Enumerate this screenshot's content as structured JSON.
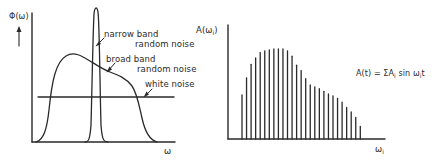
{
  "left_panel": {
    "y_axis_label": "Φ(ω)",
    "x_axis_label": "ω",
    "annotations": {
      "narrow_line1": "narrow band",
      "narrow_line2": "random noise",
      "broad_line1": "broad band",
      "broad_line2": "random noise",
      "white": "white noise"
    }
  },
  "right_panel": {
    "y_axis_label_main": "A(ω",
    "y_axis_label_sub": "i",
    "y_axis_label_end": ")",
    "x_axis_label_main": "ω",
    "x_axis_label_sub": "i",
    "formula": {
      "part1": "A(t) = ΣA",
      "sub1": "i",
      "part2": " sin ω",
      "sub2": "i",
      "part3": "t"
    }
  },
  "chart_data": [
    {
      "type": "line",
      "title": "Power spectral density of noise types",
      "xlabel": "ω",
      "ylabel": "Φ(ω)",
      "grid": false,
      "series": [
        {
          "name": "narrow band random noise",
          "shape": "sharp peak",
          "x": [
            0.3,
            0.34,
            0.36,
            0.38,
            0.42
          ],
          "y": [
            0.0,
            0.3,
            1.0,
            0.3,
            0.0
          ]
        },
        {
          "name": "broad band random noise",
          "shape": "broad hump",
          "x": [
            0.02,
            0.1,
            0.29,
            0.49,
            0.55,
            0.68,
            0.73,
            0.77,
            0.87
          ],
          "y": [
            0.0,
            0.55,
            0.66,
            0.55,
            0.51,
            0.46,
            0.33,
            0.16,
            0.0
          ]
        },
        {
          "name": "white noise",
          "shape": "flat",
          "x": [
            0.04,
            1.0
          ],
          "y": [
            0.33,
            0.33
          ]
        }
      ]
    },
    {
      "type": "bar",
      "title": "Discrete amplitude spectrum",
      "xlabel": "ω_i",
      "ylabel": "A(ω_i)",
      "grid": false,
      "categories": [
        "ω1",
        "ω2",
        "ω3",
        "ω4",
        "ω5",
        "ω6",
        "ω7",
        "ω8",
        "ω9",
        "ω10",
        "ω11",
        "ω12",
        "ω13",
        "ω14",
        "ω15",
        "ω16",
        "ω17",
        "ω18",
        "ω19",
        "ω20",
        "ω21",
        "ω22",
        "ω23",
        "ω24",
        "ω25",
        "ω26",
        "ω27"
      ],
      "values": [
        0.49,
        0.68,
        0.83,
        0.9,
        0.96,
        0.98,
        0.99,
        1.0,
        1.0,
        1.0,
        0.98,
        0.92,
        0.82,
        0.76,
        0.67,
        0.6,
        0.58,
        0.56,
        0.53,
        0.5,
        0.48,
        0.45,
        0.41,
        0.35,
        0.3,
        0.24,
        0.14
      ],
      "annotation": "A(t) = ΣA_i sin ω_i t"
    }
  ]
}
